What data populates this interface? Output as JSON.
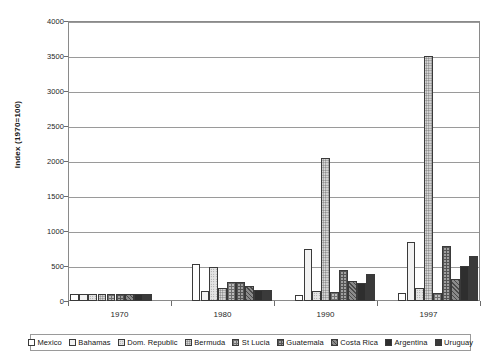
{
  "chart_data": {
    "type": "bar",
    "title": "",
    "xlabel": "",
    "ylabel": "Index (1970=100)",
    "categories": [
      "1970",
      "1980",
      "1990",
      "1997"
    ],
    "ylim": [
      0,
      4000
    ],
    "ytick_step": 500,
    "yticks": [
      "0",
      "500",
      "1000",
      "1500",
      "2000",
      "2500",
      "3000",
      "3500",
      "4000"
    ],
    "grid": true,
    "legend_position": "bottom",
    "series": [
      {
        "name": "Mexico",
        "values": [
          100,
          530,
          90,
          110
        ],
        "color": "#ffffff",
        "pattern": "solid"
      },
      {
        "name": "Bahamas",
        "values": [
          100,
          150,
          750,
          840
        ],
        "color": "#f2f2f2",
        "pattern": "dots-fine"
      },
      {
        "name": "Dom. Republic",
        "values": [
          100,
          490,
          150,
          180
        ],
        "color": "#e4e4e4",
        "pattern": "dots-light"
      },
      {
        "name": "Bermuda",
        "values": [
          100,
          180,
          2050,
          3500
        ],
        "color": "#dcdcdc",
        "pattern": "dots-med"
      },
      {
        "name": "St Lucia",
        "values": [
          100,
          270,
          130,
          120
        ],
        "color": "#bdbdbd",
        "pattern": "grid-light"
      },
      {
        "name": "Guatemala",
        "values": [
          100,
          265,
          450,
          790
        ],
        "color": "#a0a0a0",
        "pattern": "grid-med"
      },
      {
        "name": "Costa Rica",
        "values": [
          100,
          220,
          290,
          310
        ],
        "color": "#8a8a8a",
        "pattern": "hatch"
      },
      {
        "name": "Argentina",
        "values": [
          100,
          160,
          260,
          500
        ],
        "color": "#6b6b6b",
        "pattern": "dense"
      },
      {
        "name": "Uruguay",
        "values": [
          100,
          155,
          380,
          640
        ],
        "color": "#3a3a3a",
        "pattern": "solid-dark"
      }
    ],
    "extra_bars": {
      "note": "",
      "1990_last": 180,
      "1997_last": 390
    }
  }
}
